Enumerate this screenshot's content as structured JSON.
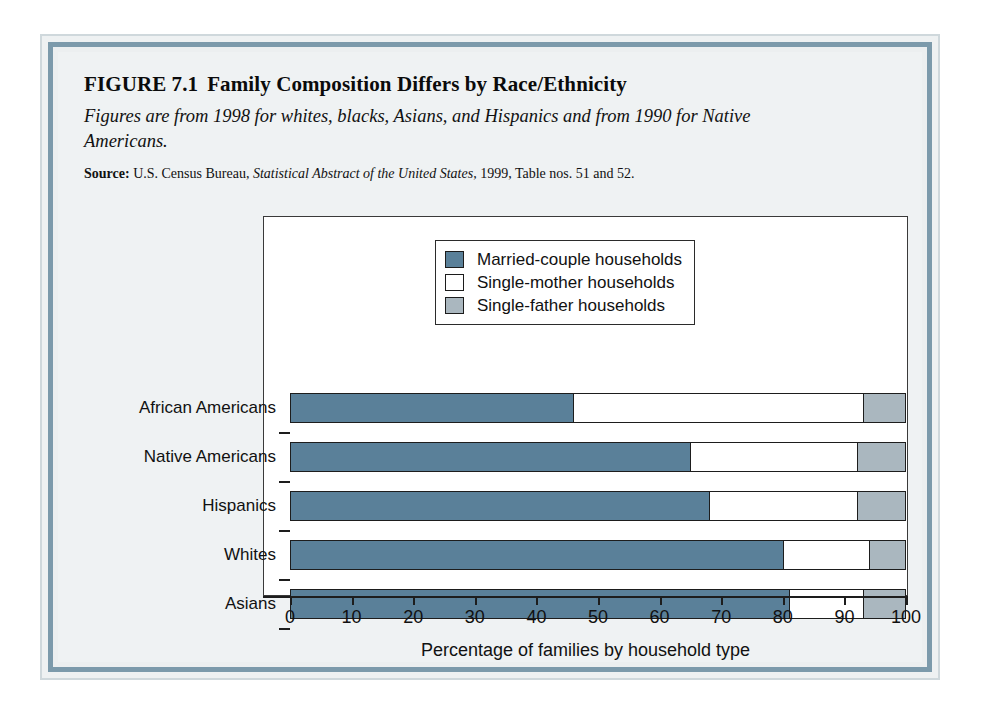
{
  "figure": {
    "number": "FIGURE 7.1",
    "title": "Family Composition Differs by Race/Ethnicity",
    "subtitle": "Figures are from 1998 for whites, blacks, Asians, and Hispanics and from 1990 for Native Americans.",
    "source_label": "Source:",
    "source_part1": "U.S. Census Bureau,",
    "source_italic": "Statistical Abstract of the United States,",
    "source_part2": "1999, Table nos. 51 and 52."
  },
  "chart_data": {
    "type": "bar",
    "orientation": "horizontal",
    "stacked": true,
    "title": "Family Composition Differs by Race/Ethnicity",
    "xlabel": "Percentage of families by household type",
    "ylabel": "",
    "xlim": [
      0,
      100
    ],
    "xticks": [
      0,
      10,
      20,
      30,
      40,
      50,
      60,
      70,
      80,
      90,
      100
    ],
    "xtick_labels": [
      "0",
      "10",
      "20",
      "30",
      "40",
      "50",
      "60",
      "70",
      "80",
      "90",
      "100"
    ],
    "grid": false,
    "legend_position": "top-center-inside",
    "categories": [
      "African Americans",
      "Native Americans",
      "Hispanics",
      "Whites",
      "Asians"
    ],
    "series": [
      {
        "name": "Married-couple households",
        "color": "#5a8099",
        "values": [
          46,
          65,
          68,
          80,
          81
        ]
      },
      {
        "name": "Single-mother households",
        "color": "#ffffff",
        "values": [
          47,
          27,
          24,
          14,
          12
        ]
      },
      {
        "name": "Single-father households",
        "color": "#aab7bf",
        "values": [
          7,
          8,
          8,
          6,
          7
        ]
      }
    ]
  },
  "colors": {
    "married": "#5a8099",
    "single_mother": "#ffffff",
    "single_father": "#aab7bf",
    "frame_border": "#7c9aab",
    "page_background": "#eff2f3",
    "axis": "#1d1d1d"
  }
}
